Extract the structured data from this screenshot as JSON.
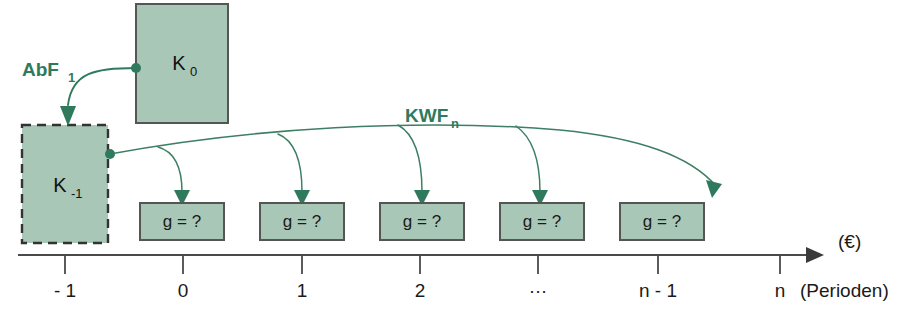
{
  "diagram": {
    "colors": {
      "box_fill": "#a9c7b6",
      "box_stroke": "#555555",
      "flow_arrow": "#2f7a5c",
      "axis": "#4a4a4a",
      "background": "#ffffff"
    },
    "capital_boxes": [
      {
        "id": "k-minus-1",
        "label_main": "K",
        "label_sub": "-1",
        "border": "dashed",
        "x": 22,
        "y": 125,
        "w": 86,
        "h": 118
      },
      {
        "id": "k-zero",
        "label_main": "K",
        "label_sub": "0",
        "border": "solid",
        "x": 136,
        "y": 4,
        "w": 92,
        "h": 119
      }
    ],
    "payment_boxes": [
      {
        "id": "g-period-0",
        "label": "g = ?",
        "x": 140,
        "y": 203,
        "w": 84,
        "h": 37
      },
      {
        "id": "g-period-1",
        "label": "g = ?",
        "x": 260,
        "y": 203,
        "w": 84,
        "h": 37
      },
      {
        "id": "g-period-2",
        "label": "g = ?",
        "x": 380,
        "y": 203,
        "w": 84,
        "h": 37
      },
      {
        "id": "g-period-dots",
        "label": "g = ?",
        "x": 500,
        "y": 203,
        "w": 84,
        "h": 37
      },
      {
        "id": "g-period-n-1",
        "label": "g = ?",
        "x": 620,
        "y": 203,
        "w": 84,
        "h": 37
      }
    ],
    "flow_labels": [
      {
        "id": "abf-label",
        "main": "AbF",
        "sub": "1",
        "x": 22,
        "y": 76
      },
      {
        "id": "kwf-label",
        "main": "KWF",
        "sub": "n",
        "x": 405,
        "y": 122
      }
    ],
    "axis": {
      "y": 255,
      "x_start": 18,
      "x_end": 822,
      "unit_label": "(€)",
      "unit_label_x": 838,
      "unit_label_y": 248,
      "periods_label": "(Perioden)",
      "periods_label_x": 800,
      "periods_label_y": 295,
      "ticks": [
        {
          "label": "- 1",
          "x": 65
        },
        {
          "label": "0",
          "x": 183
        },
        {
          "label": "1",
          "x": 302
        },
        {
          "label": "2",
          "x": 420
        },
        {
          "label": "…",
          "x": 538
        },
        {
          "label": "n - 1",
          "x": 658
        },
        {
          "label": "n",
          "x": 780
        }
      ]
    }
  }
}
